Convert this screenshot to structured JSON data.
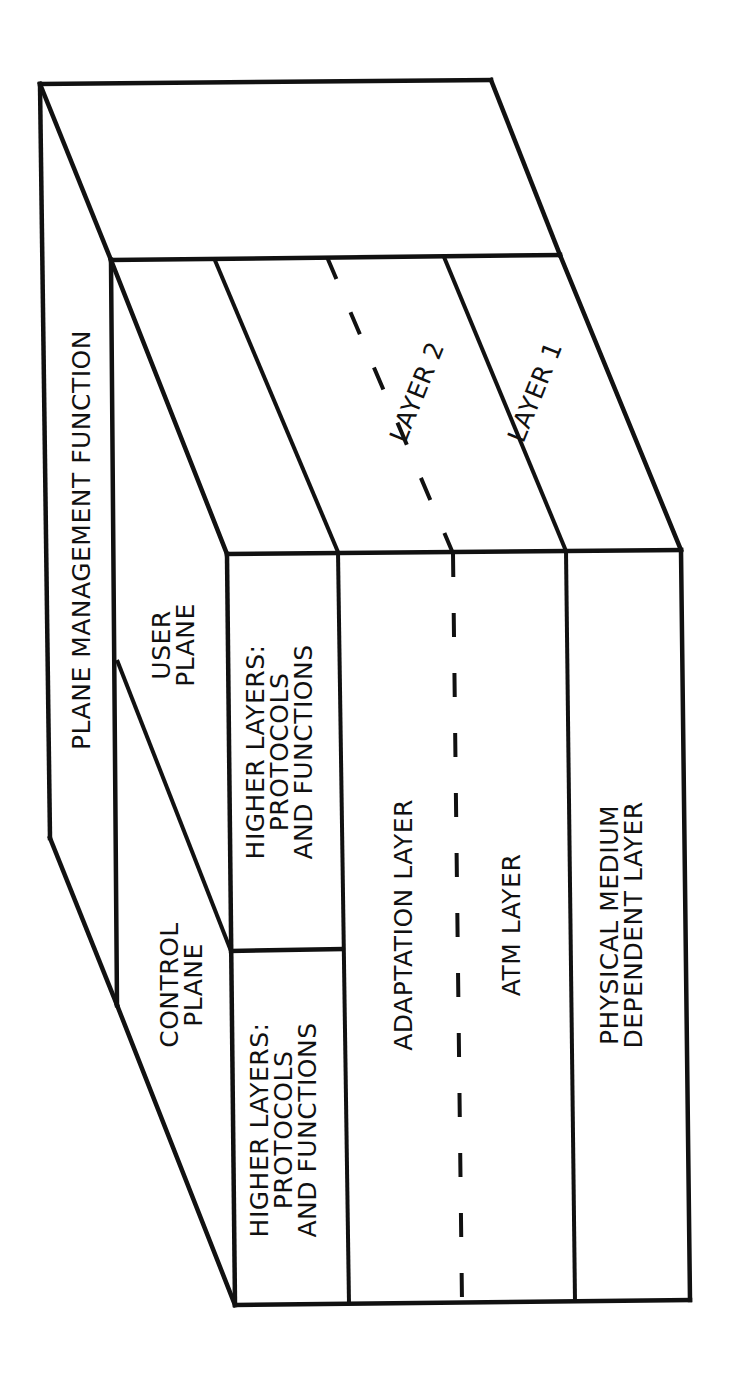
{
  "diagram": {
    "type": "3D layered cube (protocol reference model)",
    "colors": {
      "line": "#111111",
      "background": "#ffffff"
    },
    "management_strip": {
      "label": "PLANE MANAGEMENT FUNCTION"
    },
    "planes": {
      "control": {
        "line1": "CONTROL",
        "line2": "PLANE"
      },
      "user": {
        "line1": "USER",
        "line2": "PLANE"
      }
    },
    "front_face": {
      "control_higher_layers": {
        "line1": "HIGHER LAYERS:",
        "line2": "PROTOCOLS",
        "line3": "AND FUNCTIONS"
      },
      "user_higher_layers": {
        "line1": "HIGHER LAYERS:",
        "line2": "PROTOCOLS",
        "line3": "AND FUNCTIONS"
      },
      "adaptation_layer": "ADAPTATION LAYER",
      "atm_layer": "ATM LAYER",
      "physical_layer": {
        "line1": "PHYSICAL MEDIUM",
        "line2": "DEPENDENT LAYER"
      }
    },
    "side_face": {
      "layer2": "LAYER 2",
      "layer1": "LAYER 1"
    }
  }
}
